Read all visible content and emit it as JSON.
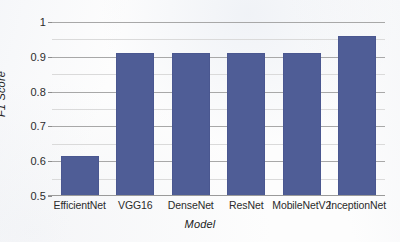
{
  "chart_data": {
    "type": "bar",
    "title": "",
    "xlabel": "Model",
    "ylabel": "F1 Score",
    "categories": [
      "EfficientNet",
      "VGG16",
      "DenseNet",
      "ResNet",
      "MobileNetV2",
      "InceptionNet"
    ],
    "values": [
      0.615,
      0.91,
      0.91,
      0.91,
      0.91,
      0.96
    ],
    "ylim": [
      0.5,
      1.0
    ],
    "y_major_ticks": [
      0.5,
      0.6,
      0.7,
      0.8,
      0.9,
      1.0
    ],
    "y_tick_labels": [
      "0.5",
      "0.6",
      "0.7",
      "0.8",
      "0.9",
      "1"
    ],
    "y_minor_ticks": [
      0.55,
      0.65,
      0.75,
      0.85,
      0.95
    ],
    "grid": true,
    "legend": false,
    "bar_color": "#4f5d96",
    "grid_color": "#a8a8a8",
    "minor_grid_color": "#dadada"
  }
}
